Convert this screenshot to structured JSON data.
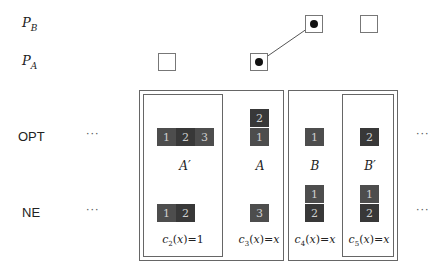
{
  "rows": {
    "pb": {
      "label": "P",
      "sub": "B"
    },
    "pa": {
      "label": "P",
      "sub": "A"
    },
    "opt": {
      "label": "OPT",
      "ellipsis_left": "···",
      "ellipsis_right": "···"
    },
    "ne": {
      "label": "NE",
      "ellipsis_left": "···",
      "ellipsis_right": "···"
    }
  },
  "groups": [
    {
      "id": "A_prime",
      "label": "A′",
      "opt_cells": [
        "1",
        "2",
        "3"
      ],
      "ne_cells": [
        "1",
        "2"
      ],
      "cost": {
        "fn": "c",
        "sub": "2",
        "arg": "x",
        "value": "1"
      }
    },
    {
      "id": "A",
      "label": "A",
      "opt_cells": [
        "2",
        "1"
      ],
      "ne_cells": [
        "3"
      ],
      "cost": {
        "fn": "c",
        "sub": "3",
        "arg": "x",
        "value": "x"
      }
    },
    {
      "id": "B",
      "label": "B",
      "opt_cells": [
        "1"
      ],
      "ne_cells": [
        "1",
        "2"
      ],
      "cost": {
        "fn": "c",
        "sub": "4",
        "arg": "x",
        "value": "x"
      }
    },
    {
      "id": "B_prime",
      "label": "B′",
      "opt_cells": [
        "2"
      ],
      "ne_cells": [
        "1",
        "2"
      ],
      "cost": {
        "fn": "c",
        "sub": "5",
        "arg": "x",
        "value": "x"
      }
    }
  ],
  "colors": {
    "cell_light": "#4d4d4d",
    "cell_dark": "#383838",
    "cell_text": "#cfcfcf",
    "frame": "#666666",
    "edge": "#555555"
  }
}
